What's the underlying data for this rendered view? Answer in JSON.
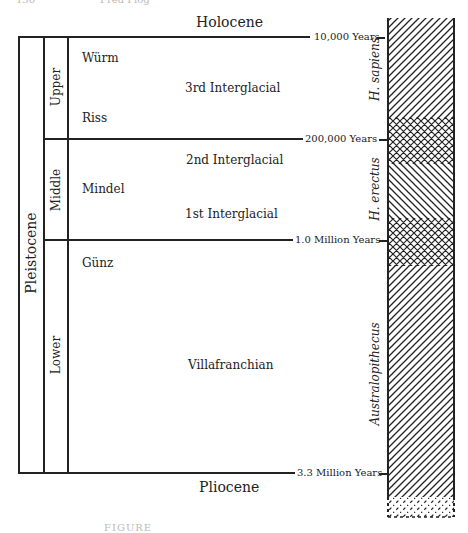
{
  "header_fragment": {
    "page_number": "136",
    "running_head": "Fred Plog"
  },
  "epochs": {
    "top": "Holocene",
    "bottom": "Pliocene",
    "main": "Pleistocene"
  },
  "subdivisions": [
    {
      "label": "Upper"
    },
    {
      "label": "Middle"
    },
    {
      "label": "Lower"
    }
  ],
  "stages": {
    "wurm": "Würm",
    "riss": "Riss",
    "mindel": "Mindel",
    "gunz": "Günz",
    "interglacial_3": "3rd Interglacial",
    "interglacial_2": "2nd Interglacial",
    "interglacial_1": "1st Interglacial",
    "villafranchian": "Villafranchian"
  },
  "dates": {
    "d1": "10,000 Years",
    "d2": "200,000 Years",
    "d3": "1.0 Million Years",
    "d4": "3.3 Million Years"
  },
  "hominids": {
    "sapiens": "H. sapiens",
    "erectus": "H. erectus",
    "australopithecus": "Australopithecus"
  },
  "caption_fragment": "FIGURE"
}
